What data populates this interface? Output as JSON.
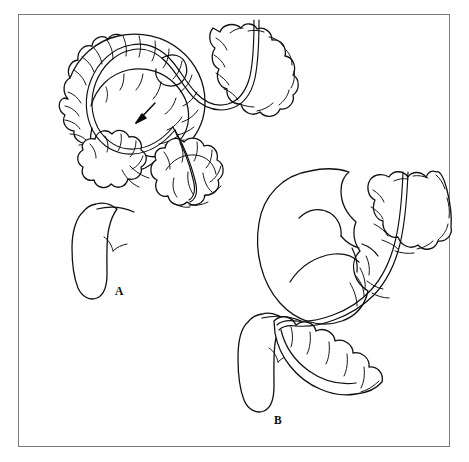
{
  "figure": {
    "background_color": "#ffffff",
    "frame_color": "#7a7a7a",
    "ink_color": "#111111",
    "panels": [
      {
        "id": "panel-a",
        "label": "A",
        "label_x": 115,
        "label_y": 286,
        "caption": "Twisted sigmoid colon with endoscope advanced to the point of torsion",
        "features": [
          "sigmoid-colon-loop",
          "haustra",
          "endoscope-tube",
          "torsion-point",
          "rectum",
          "direction-arrow"
        ]
      },
      {
        "id": "panel-b",
        "label": "B",
        "label_x": 274,
        "label_y": 415,
        "caption": "Distended sigmoid loop after decompression with rectal tube in place",
        "features": [
          "distended-sigmoid-loop",
          "haustra",
          "endoscope-tube",
          "descending-colon",
          "rectum"
        ]
      }
    ]
  }
}
